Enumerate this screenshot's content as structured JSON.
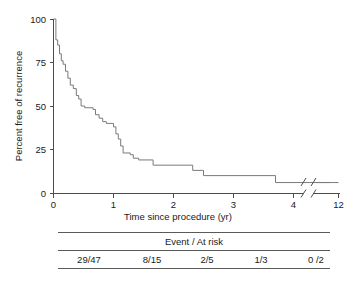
{
  "chart_data": {
    "type": "line",
    "subtype": "kaplan-meier-step",
    "title": "",
    "xlabel": "Time since procedure (yr)",
    "ylabel": "Percent free of recurrence",
    "xlim": [
      0,
      12
    ],
    "ylim": [
      0,
      100
    ],
    "grid": false,
    "legend": "none",
    "x_ticks": [
      "0",
      "1",
      "2",
      "3",
      "4",
      "12"
    ],
    "x_tick_values": [
      0,
      1,
      2,
      3,
      4,
      12
    ],
    "y_ticks": [
      "0",
      "25",
      "50",
      "75",
      "100"
    ],
    "y_tick_values": [
      0,
      25,
      50,
      75,
      100
    ],
    "axis_break": {
      "present": true,
      "between": [
        4.6,
        11.5
      ],
      "note": "slash break on x-axis and on the curve"
    },
    "series": [
      {
        "name": "Percent free of recurrence",
        "color": "#7a7a7a",
        "steps": [
          {
            "x": 0.0,
            "y": 100
          },
          {
            "x": 0.04,
            "y": 88
          },
          {
            "x": 0.07,
            "y": 85
          },
          {
            "x": 0.1,
            "y": 80
          },
          {
            "x": 0.13,
            "y": 76
          },
          {
            "x": 0.16,
            "y": 74
          },
          {
            "x": 0.2,
            "y": 70
          },
          {
            "x": 0.24,
            "y": 66
          },
          {
            "x": 0.28,
            "y": 62
          },
          {
            "x": 0.33,
            "y": 60
          },
          {
            "x": 0.38,
            "y": 56
          },
          {
            "x": 0.42,
            "y": 54
          },
          {
            "x": 0.46,
            "y": 50
          },
          {
            "x": 0.52,
            "y": 49
          },
          {
            "x": 0.66,
            "y": 48
          },
          {
            "x": 0.7,
            "y": 45
          },
          {
            "x": 0.76,
            "y": 43
          },
          {
            "x": 0.82,
            "y": 41
          },
          {
            "x": 0.88,
            "y": 40
          },
          {
            "x": 1.0,
            "y": 38
          },
          {
            "x": 1.04,
            "y": 34
          },
          {
            "x": 1.08,
            "y": 31
          },
          {
            "x": 1.12,
            "y": 27
          },
          {
            "x": 1.16,
            "y": 23
          },
          {
            "x": 1.28,
            "y": 22
          },
          {
            "x": 1.33,
            "y": 20
          },
          {
            "x": 1.42,
            "y": 19
          },
          {
            "x": 1.66,
            "y": 16
          },
          {
            "x": 2.32,
            "y": 13
          },
          {
            "x": 2.5,
            "y": 10
          },
          {
            "x": 3.7,
            "y": 6
          },
          {
            "x": 4.6,
            "y": 6
          },
          {
            "x": 12.0,
            "y": 6
          }
        ]
      }
    ],
    "risk_table": {
      "header": "Event / At risk",
      "cells": [
        "29/47",
        "8/15",
        "2/5",
        "1/3",
        "0 /2"
      ],
      "cell_x_positions": [
        0.6,
        1.65,
        2.55,
        3.45,
        4.45
      ]
    }
  },
  "figure": {
    "background_color": "#ffffff",
    "axis_color": "#4d4d4d",
    "curve_color": "#7a7a7a",
    "text_color": "#1a1a1a"
  }
}
